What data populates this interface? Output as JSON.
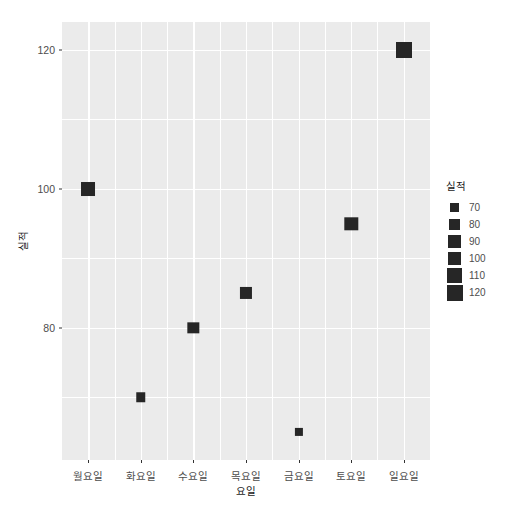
{
  "chart_data": {
    "type": "scatter",
    "title": "",
    "xlabel": "요일",
    "ylabel": "실적",
    "categories": [
      "월요일",
      "화요일",
      "수요일",
      "목요일",
      "금요일",
      "토요일",
      "일요일"
    ],
    "values": [
      100,
      70,
      80,
      85,
      65,
      95,
      120
    ],
    "points": [
      {
        "x": "월요일",
        "y": 100,
        "size": 100
      },
      {
        "x": "화요일",
        "y": 70,
        "size": 70
      },
      {
        "x": "수요일",
        "y": 80,
        "size": 80
      },
      {
        "x": "목요일",
        "y": 85,
        "size": 85
      },
      {
        "x": "금요일",
        "y": 65,
        "size": 65
      },
      {
        "x": "토요일",
        "y": 95,
        "size": 95
      },
      {
        "x": "일요일",
        "y": 120,
        "size": 120
      }
    ],
    "ylim": [
      61,
      124
    ],
    "y_ticks": [
      80,
      100,
      120
    ],
    "y_tick_labels": [
      "80",
      "100",
      "120"
    ],
    "y_minor_ticks": [
      70,
      90,
      110
    ],
    "grid": true,
    "legend_position": "right",
    "legend": {
      "title": "실적",
      "entries": [
        {
          "label": "70",
          "value": 70
        },
        {
          "label": "80",
          "value": 80
        },
        {
          "label": "90",
          "value": 90
        },
        {
          "label": "100",
          "value": 100
        },
        {
          "label": "110",
          "value": 110
        },
        {
          "label": "120",
          "value": 120
        }
      ]
    },
    "colors": {
      "panel_background": "#ebebeb",
      "grid": "#ffffff",
      "point": "#262626",
      "axis_text": "#4d4d4d",
      "axis_title": "#1a1a1a",
      "page_background": "#ffffff"
    }
  }
}
